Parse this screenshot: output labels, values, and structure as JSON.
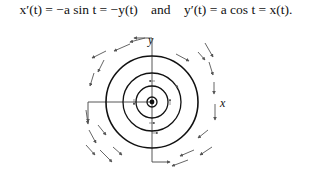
{
  "equation": {
    "left": "x′(t) = −a sin t = −y(t)",
    "connector": "and",
    "right": "y′(t) = a cos t = x(t)."
  },
  "figure": {
    "axis_label_y": "y",
    "axis_label_x": "x",
    "center": [
      152,
      102
    ],
    "ring_radii": [
      5,
      16,
      29,
      46
    ],
    "colors": {
      "ring": "#111111",
      "arrow": "#555555",
      "axis": "#444444"
    }
  }
}
